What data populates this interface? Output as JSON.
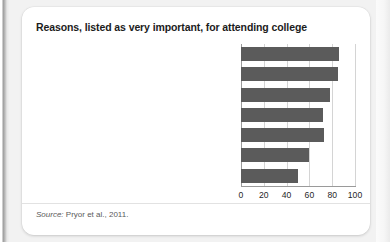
{
  "figure": {
    "title": "Reasons, listed as very important, for attending college",
    "source_prefix": "Source:",
    "source_text": " Pryor et al., 2011."
  },
  "chart_data": {
    "type": "bar",
    "orientation": "horizontal",
    "title": "Reasons, listed as very important, for attending college",
    "xlabel": "",
    "ylabel": "",
    "xlim": [
      0,
      100
    ],
    "xticks": [
      0,
      20,
      40,
      60,
      80,
      100
    ],
    "grid": true,
    "legend": false,
    "bar_color": "#5b5b5b",
    "categories": [
      "Ability to get a better job",
      "Learn more about things of interest",
      "Train for a specific career",
      "Gain a general education, appreciation of ideas",
      "Ability to make more money",
      "Prepare for graduate or professional school",
      "Become a more cultured person"
    ],
    "values": [
      86,
      85,
      78,
      72,
      73,
      60,
      50
    ]
  }
}
